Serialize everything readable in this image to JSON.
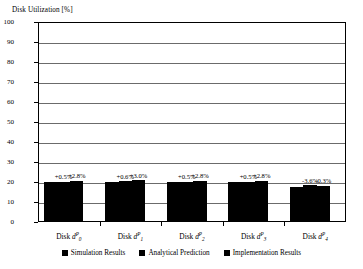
{
  "chart_data": {
    "type": "bar",
    "title": "Disk Utilization [%]",
    "xlabel": "",
    "ylabel": "Disk Utilization [%]",
    "ylim": [
      0,
      100
    ],
    "ytick_step": 10,
    "ytick_labels": [
      "100",
      "90",
      "80",
      "70",
      "60",
      "50",
      "40",
      "30",
      "20",
      "10",
      "0"
    ],
    "grid": true,
    "legend_position": "bottom",
    "categories": [
      "Disk d0P",
      "Disk d1P",
      "Disk d2P",
      "Disk d3P",
      "Disk d4P"
    ],
    "category_labels": [
      {
        "prefix": "Disk ",
        "var": "d",
        "sub": "0",
        "sup": "P"
      },
      {
        "prefix": "Disk ",
        "var": "d",
        "sub": "1",
        "sup": "P"
      },
      {
        "prefix": "Disk ",
        "var": "d",
        "sub": "2",
        "sup": "P"
      },
      {
        "prefix": "Disk ",
        "var": "d",
        "sub": "3",
        "sup": "P"
      },
      {
        "prefix": "Disk ",
        "var": "d",
        "sub": "4",
        "sup": "P"
      }
    ],
    "series": [
      {
        "name": "Simulation Results",
        "values": [
          20.1,
          20.2,
          20.0,
          20.0,
          17.6
        ]
      },
      {
        "name": "Analytical Prediction",
        "values": [
          20.2,
          20.3,
          20.1,
          20.1,
          18.3
        ]
      },
      {
        "name": "Implementation Results",
        "values": [
          20.7,
          20.8,
          20.6,
          20.6,
          18.2
        ]
      }
    ],
    "annotations": [
      {
        "group": 0,
        "labels": [
          "+0.5%",
          "+2.8%"
        ]
      },
      {
        "group": 1,
        "labels": [
          "+0.6%",
          "+3.0%"
        ]
      },
      {
        "group": 2,
        "labels": [
          "+0.5%",
          "+2.8%"
        ]
      },
      {
        "group": 3,
        "labels": [
          "+0.5%",
          "+2.8%"
        ]
      },
      {
        "group": 4,
        "labels": [
          "-3.6%",
          "-0.3%"
        ]
      }
    ],
    "bar_color": "#000000",
    "grid_color": "#6b6b6b",
    "frame_color": "#000000"
  },
  "legend": {
    "items": [
      {
        "label": "Simulation Results"
      },
      {
        "label": "Analytical Prediction"
      },
      {
        "label": "Implementation Results"
      }
    ]
  }
}
